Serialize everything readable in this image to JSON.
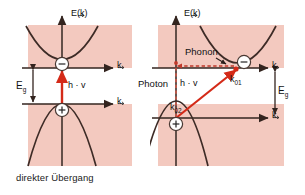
{
  "figure": {
    "type": "band-structure-diagram",
    "colors": {
      "band_fill": "#f3c9bf",
      "band_fill_light": "#f7d6cd",
      "curve": "#3d2b26",
      "axis": "#4a3a34",
      "transition_arrow": "#d42a18",
      "phonon_arrow": "#c0392b",
      "background": "#ffffff",
      "text": "#151515"
    }
  },
  "panels": [
    {
      "id": "direct",
      "caption": "direkter Übergang",
      "energy_axis_label": "E(k)",
      "momentum_axis_label": "k",
      "gap_label": "E",
      "gap_label_sub": "g",
      "transition_label": "h · v",
      "carriers": [
        {
          "name": "electron",
          "glyph": "−"
        },
        {
          "name": "hole",
          "glyph": "+"
        }
      ],
      "axis_labels_count": 2
    },
    {
      "id": "indirect",
      "caption": "indirekter Übergang",
      "energy_axis_label": "E(k)",
      "momentum_axis_label": "k",
      "gap_label": "E",
      "gap_label_sub": "g",
      "transition_label": "h · v",
      "photon_label": "Photon",
      "phonon_label": "Phonon",
      "k_upper_label": "k",
      "k_upper_sub": "01",
      "k_lower_label": "k",
      "k_lower_sub": "02",
      "carriers": [
        {
          "name": "electron",
          "glyph": "−"
        },
        {
          "name": "hole",
          "glyph": "+"
        }
      ],
      "axis_labels_count": 2
    }
  ]
}
